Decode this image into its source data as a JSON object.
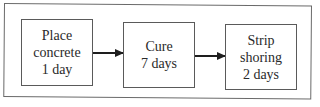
{
  "diagram": {
    "type": "flowchart",
    "direction": "left-to-right",
    "steps": [
      {
        "id": "place-concrete",
        "lines": [
          "Place",
          "concrete",
          "1 day"
        ]
      },
      {
        "id": "cure",
        "lines": [
          "Cure",
          "7 days"
        ]
      },
      {
        "id": "strip-shoring",
        "lines": [
          "Strip",
          "shoring",
          "2 days"
        ]
      }
    ],
    "connections": [
      {
        "from": "place-concrete",
        "to": "cure"
      },
      {
        "from": "cure",
        "to": "strip-shoring"
      }
    ],
    "colors": {
      "line": "#5a5a5a",
      "arrow": "#1e1e1e",
      "text": "#2a2a2a",
      "background": "#ffffff"
    }
  }
}
